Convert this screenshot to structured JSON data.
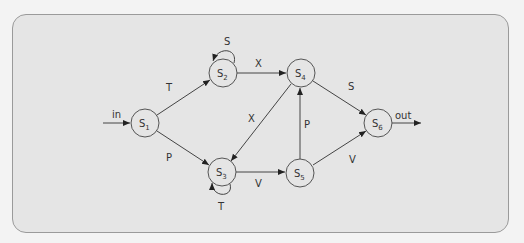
{
  "diagram": {
    "type": "state-machine",
    "colors": {
      "background": "#f3f3f3",
      "panel": "#e5e5e5",
      "stroke": "#444444"
    },
    "nodes": [
      {
        "id": "S1",
        "letter": "S",
        "sub": "1",
        "x": 145,
        "y": 123
      },
      {
        "id": "S2",
        "letter": "S",
        "sub": "2",
        "x": 223,
        "y": 73
      },
      {
        "id": "S3",
        "letter": "S",
        "sub": "3",
        "x": 222,
        "y": 172
      },
      {
        "id": "S4",
        "letter": "S",
        "sub": "4",
        "x": 301,
        "y": 73
      },
      {
        "id": "S5",
        "letter": "S",
        "sub": "5",
        "x": 300,
        "y": 173
      },
      {
        "id": "S6",
        "letter": "S",
        "sub": "6",
        "x": 378,
        "y": 123
      }
    ],
    "edges": [
      {
        "from": "in",
        "to": "S1",
        "label": "in"
      },
      {
        "from": "S1",
        "to": "S2",
        "label": "T"
      },
      {
        "from": "S1",
        "to": "S3",
        "label": "P"
      },
      {
        "from": "S2",
        "to": "S2",
        "label": "S"
      },
      {
        "from": "S2",
        "to": "S4",
        "label": "X"
      },
      {
        "from": "S3",
        "to": "S3",
        "label": "T"
      },
      {
        "from": "S3",
        "to": "S5",
        "label": "V"
      },
      {
        "from": "S4",
        "to": "S3",
        "label": "X"
      },
      {
        "from": "S4",
        "to": "S6",
        "label": "S"
      },
      {
        "from": "S5",
        "to": "S4",
        "label": "P"
      },
      {
        "from": "S5",
        "to": "S6",
        "label": "V"
      },
      {
        "from": "S6",
        "to": "out",
        "label": "out"
      }
    ]
  }
}
